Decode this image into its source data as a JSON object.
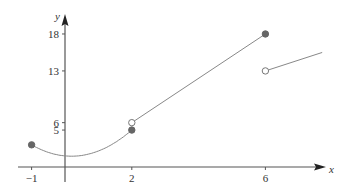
{
  "chart_data": {
    "type": "line",
    "title": "",
    "xlabel": "x",
    "ylabel": "y",
    "x_ticks": [
      -1,
      2,
      6
    ],
    "x_tick_labels": [
      "−1",
      "2",
      "6"
    ],
    "y_ticks": [
      5,
      6,
      13,
      18
    ],
    "y_tick_labels": [
      "5",
      "6",
      "13",
      "18"
    ],
    "xlim": [
      -1.5,
      8.5
    ],
    "ylim": [
      -1,
      19.5
    ],
    "grid": false,
    "legend": null,
    "series": [
      {
        "name": "piece-1 (curve)",
        "kind": "curve",
        "x": [
          -1,
          -0.5,
          0,
          0.5,
          1,
          1.5,
          2
        ],
        "y": [
          3,
          1.9,
          1.5,
          1.8,
          2.6,
          3.7,
          5
        ],
        "start_marker": "filled",
        "end_marker": "filled"
      },
      {
        "name": "piece-2 (line)",
        "kind": "line",
        "x": [
          2,
          6
        ],
        "y": [
          6,
          18
        ],
        "start_marker": "open",
        "end_marker": "filled"
      },
      {
        "name": "piece-3 (line)",
        "kind": "line",
        "x": [
          6,
          7.7
        ],
        "y": [
          13,
          15.5
        ],
        "start_marker": "open",
        "end_marker": "none"
      }
    ],
    "points": [
      {
        "x": -1,
        "y": 3,
        "marker": "filled"
      },
      {
        "x": 2,
        "y": 5,
        "marker": "filled"
      },
      {
        "x": 2,
        "y": 6,
        "marker": "open"
      },
      {
        "x": 6,
        "y": 18,
        "marker": "filled"
      },
      {
        "x": 6,
        "y": 13,
        "marker": "open"
      }
    ]
  },
  "colors": {
    "axis": "#555555",
    "curve": "#888888",
    "filled_point": "#666666"
  }
}
